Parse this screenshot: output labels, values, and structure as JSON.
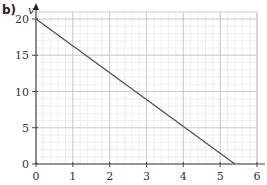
{
  "part_label": "b)",
  "chart_data": {
    "type": "line",
    "title": "",
    "xlabel": "",
    "ylabel": "v",
    "x_ticks": [
      0,
      1,
      2,
      3,
      4,
      5,
      6
    ],
    "y_ticks": [
      0,
      5,
      10,
      15,
      20
    ],
    "xlim": [
      0,
      6
    ],
    "ylim": [
      0,
      21
    ],
    "grid": true,
    "minor_grid": true,
    "legend": null,
    "series": [
      {
        "name": "v",
        "x": [
          0,
          5.4
        ],
        "y": [
          20,
          0
        ],
        "color": "#555555"
      }
    ]
  },
  "colors": {
    "major_grid": "#c8c8c8",
    "minor_grid": "#e4e4e4",
    "axis": "#444444",
    "line": "#555555"
  }
}
